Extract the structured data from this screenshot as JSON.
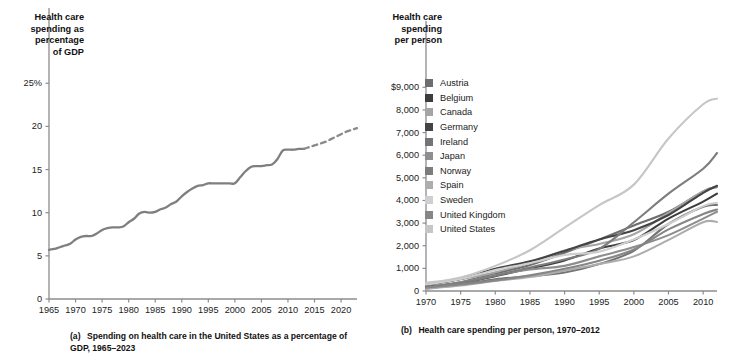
{
  "figure": {
    "background": "#ffffff",
    "panel_a": {
      "axis_title": "Health care\nspending as\npercentage\nof GDP",
      "caption_label": "(a)",
      "caption_text": "Spending on health care in the United States as a percentage of GDP, 1965–2023",
      "line_color": "#7f7f7f",
      "axis_color": "#8c8c8c"
    },
    "panel_b": {
      "axis_title": "Health care\nspending\nper person",
      "caption_label": "(b)",
      "caption_text": "Health care spending per person, 1970–2012",
      "axis_color": "#8c8c8c"
    }
  },
  "chart_data": [
    {
      "type": "line",
      "panel": "a",
      "title": "Spending on health care in the United States as a percentage of GDP, 1965–2023",
      "xlabel": "",
      "ylabel": "Health care spending as percentage of GDP",
      "xlim": [
        1965,
        2023
      ],
      "ylim": [
        0,
        27
      ],
      "xticks": [
        1965,
        1970,
        1975,
        1980,
        1985,
        1990,
        1995,
        2000,
        2005,
        2010,
        2015,
        2020
      ],
      "xtick_labels": [
        "1965",
        "1970",
        "1975",
        "1980",
        "1985",
        "1990",
        "1995",
        "2000",
        "2005",
        "2010",
        "2015",
        "2020"
      ],
      "yticks": [
        0,
        5,
        10,
        15,
        20,
        25
      ],
      "ytick_labels": [
        "0",
        "5",
        "10",
        "15",
        "20",
        "25%"
      ],
      "grid": false,
      "legend": "none",
      "series": [
        {
          "name": "United States health care spending share of GDP",
          "style": "solid",
          "color": "#7f7f7f",
          "x": [
            1965,
            1966,
            1967,
            1968,
            1969,
            1970,
            1971,
            1972,
            1973,
            1974,
            1975,
            1976,
            1977,
            1978,
            1979,
            1980,
            1981,
            1982,
            1983,
            1984,
            1985,
            1986,
            1987,
            1988,
            1989,
            1990,
            1991,
            1992,
            1993,
            1994,
            1995,
            1996,
            1997,
            1998,
            1999,
            2000,
            2001,
            2002,
            2003,
            2004,
            2005,
            2006,
            2007,
            2008,
            2009,
            2010,
            2011,
            2012,
            2013
          ],
          "y": [
            5.7,
            5.8,
            6.0,
            6.2,
            6.4,
            6.9,
            7.2,
            7.3,
            7.3,
            7.6,
            8.0,
            8.2,
            8.3,
            8.3,
            8.4,
            8.9,
            9.3,
            9.9,
            10.1,
            10.0,
            10.1,
            10.4,
            10.6,
            11.0,
            11.3,
            11.9,
            12.4,
            12.8,
            13.1,
            13.2,
            13.4,
            13.4,
            13.4,
            13.4,
            13.4,
            13.4,
            14.1,
            14.8,
            15.3,
            15.4,
            15.4,
            15.5,
            15.6,
            16.2,
            17.2,
            17.3,
            17.3,
            17.4,
            17.4
          ]
        },
        {
          "name": "Projected health care spending share of GDP",
          "style": "dashed",
          "color": "#8a8a8a",
          "x": [
            2013,
            2014,
            2015,
            2016,
            2017,
            2018,
            2019,
            2020,
            2021,
            2022,
            2023
          ],
          "y": [
            17.4,
            17.6,
            17.8,
            18.0,
            18.2,
            18.5,
            18.8,
            19.1,
            19.4,
            19.6,
            19.8
          ]
        }
      ]
    },
    {
      "type": "line",
      "panel": "b",
      "title": "Health care spending per person, 1970–2012",
      "xlabel": "",
      "ylabel": "Health care spending per person",
      "xlim": [
        1970,
        2012
      ],
      "ylim": [
        0,
        9500
      ],
      "xticks": [
        1970,
        1975,
        1980,
        1985,
        1990,
        1995,
        2000,
        2005,
        2010
      ],
      "xtick_labels": [
        "1970",
        "1975",
        "1980",
        "1985",
        "1990",
        "1995",
        "2000",
        "2005",
        "2010"
      ],
      "yticks": [
        0,
        1000,
        2000,
        3000,
        4000,
        5000,
        6000,
        7000,
        8000,
        9000
      ],
      "ytick_labels": [
        "0",
        "1,000",
        "2,000",
        "3,000",
        "4,000",
        "5,000",
        "6,000",
        "7,000",
        "8,000",
        "$9,000"
      ],
      "grid": false,
      "legend": "inside-left",
      "x": [
        1970,
        1975,
        1980,
        1985,
        1990,
        1995,
        2000,
        2005,
        2010,
        2012
      ],
      "series": [
        {
          "name": "Austria",
          "color": "#6e6e6e",
          "values": [
            190,
            390,
            780,
            1150,
            1690,
            2270,
            2890,
            3500,
            4400,
            4600
          ]
        },
        {
          "name": "Belgium",
          "color": "#3d3d3d",
          "values": [
            150,
            350,
            650,
            1000,
            1350,
            1880,
            2250,
            3200,
            3950,
            4300
          ]
        },
        {
          "name": "Canada",
          "color": "#a5a5a5",
          "values": [
            280,
            520,
            830,
            1250,
            1790,
            2080,
            2510,
            3450,
            4400,
            4600
          ]
        },
        {
          "name": "Germany",
          "color": "#444444",
          "values": [
            260,
            530,
            980,
            1310,
            1770,
            2280,
            2680,
            3360,
            4340,
            4650
          ]
        },
        {
          "name": "Ireland",
          "color": "#747474",
          "values": [
            110,
            290,
            520,
            650,
            820,
            1190,
            1780,
            2960,
            3720,
            3800
          ]
        },
        {
          "name": "Japan",
          "color": "#8e8e8e",
          "values": [
            140,
            380,
            700,
            950,
            1110,
            1530,
            1940,
            2470,
            3200,
            3500
          ]
        },
        {
          "name": "Norway",
          "color": "#7d7d7d",
          "values": [
            140,
            360,
            680,
            1040,
            1390,
            1860,
            3040,
            4300,
            5400,
            6100
          ]
        },
        {
          "name": "Spain",
          "color": "#adadad",
          "values": [
            95,
            240,
            440,
            620,
            900,
            1190,
            1530,
            2260,
            3040,
            3050
          ]
        },
        {
          "name": "Sweden",
          "color": "#cfcfcf",
          "values": [
            280,
            530,
            930,
            1230,
            1590,
            1740,
            2280,
            2960,
            3750,
            3900
          ]
        },
        {
          "name": "United Kingdom",
          "color": "#868686",
          "values": [
            150,
            290,
            470,
            690,
            980,
            1340,
            1830,
            2720,
            3400,
            3600
          ]
        },
        {
          "name": "United States",
          "color": "#c6c6c6",
          "values": [
            350,
            600,
            1110,
            1800,
            2800,
            3790,
            4700,
            6740,
            8250,
            8500
          ]
        }
      ]
    }
  ],
  "legend_items": [
    {
      "label": "Austria",
      "color": "#6e6e6e"
    },
    {
      "label": "Belgium",
      "color": "#3d3d3d"
    },
    {
      "label": "Canada",
      "color": "#a5a5a5"
    },
    {
      "label": "Germany",
      "color": "#444444"
    },
    {
      "label": "Ireland",
      "color": "#747474"
    },
    {
      "label": "Japan",
      "color": "#8e8e8e"
    },
    {
      "label": "Norway",
      "color": "#7d7d7d"
    },
    {
      "label": "Spain",
      "color": "#adadad"
    },
    {
      "label": "Sweden",
      "color": "#cfcfcf"
    },
    {
      "label": "United Kingdom",
      "color": "#868686"
    },
    {
      "label": "United States",
      "color": "#c6c6c6"
    }
  ]
}
